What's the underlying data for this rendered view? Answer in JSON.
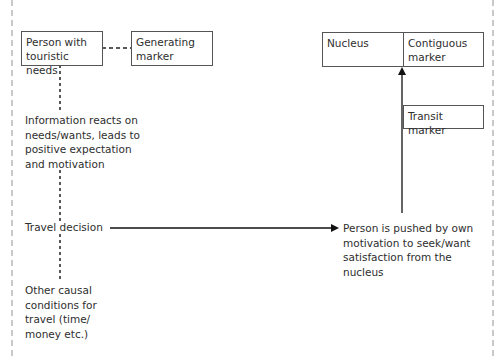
{
  "diagram": {
    "boxes": {
      "person": "Person with\ntouristic needs",
      "generating": "Generating\nmarker",
      "nucleus": "Nucleus",
      "contiguous": "Contiguous\nmarker",
      "transit": "Transit marker"
    },
    "labels": {
      "information": "Information reacts on\nneeds/wants, leads to\npositive expectation\nand motivation",
      "travel_decision": "Travel decision",
      "other_conditions": "Other causal\nconditions for\ntravel (time/\nmoney etc.)",
      "pushed": "Person is pushed by own\nmotivation to seek/want\nsatisfaction from the\nnucleus"
    },
    "colors": {
      "line": "#111111",
      "box_border": "#555555",
      "text": "#2e2e2e",
      "frame": "#c9c9c9"
    }
  }
}
